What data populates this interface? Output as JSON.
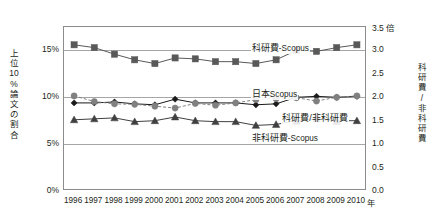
{
  "chart_data": {
    "type": "line",
    "title": "",
    "xlabel": "年",
    "x": [
      1996,
      1997,
      1998,
      1999,
      2000,
      2001,
      2002,
      2003,
      2004,
      2005,
      2006,
      2007,
      2008,
      2009,
      2010
    ],
    "x_tick_labels": [
      "1996",
      "1997",
      "1998",
      "1999",
      "2000",
      "2001",
      "2002",
      "2003",
      "2004",
      "2005",
      "2006",
      "2007",
      "2008",
      "2009",
      "2010"
    ],
    "x_unit_label": "年",
    "grid": true,
    "legend_position": "inline-annotations",
    "axes": {
      "left": {
        "label": "上位10%論文の割合",
        "label_chars": [
          "上",
          "位",
          "10",
          "%",
          "論",
          "文",
          "の",
          "割",
          "合"
        ],
        "ticks": [
          0,
          5,
          10,
          15
        ],
        "tick_labels": [
          "0%",
          "5%",
          "10%",
          "15%"
        ],
        "lim": [
          0,
          17.5
        ],
        "unit": "%"
      },
      "right": {
        "label": "科研費/非科研費",
        "label_chars": [
          "科",
          "研",
          "費",
          "/",
          "非",
          "科",
          "研",
          "費"
        ],
        "ticks": [
          0.0,
          0.5,
          1.0,
          1.5,
          2.0,
          2.5,
          3.0,
          3.5
        ],
        "tick_labels": [
          "0.0",
          "0.5",
          "1.0",
          "1.5",
          "2.0",
          "2.5",
          "3.0",
          "3.5"
        ],
        "lim": [
          0.0,
          3.5
        ],
        "unit": "倍",
        "unit_label": "3.5 倍"
      }
    },
    "series": [
      {
        "name": "科研費-Scopus",
        "label_jp": "科研費",
        "label_lat": "-Scopus",
        "axis": "left",
        "marker": "square",
        "color": "#595959",
        "linestyle": "solid",
        "values": [
          15.6,
          15.3,
          14.6,
          14.0,
          13.6,
          14.2,
          14.1,
          13.8,
          13.8,
          13.6,
          14.0,
          15.0,
          14.9,
          15.3,
          15.6
        ]
      },
      {
        "name": "日本Scopus",
        "label_jp": "日本",
        "label_lat": "Scopus",
        "axis": "left",
        "marker": "diamond",
        "color": "#1a1a1a",
        "linestyle": "solid",
        "values": [
          9.4,
          9.4,
          9.5,
          9.3,
          9.2,
          9.8,
          9.4,
          9.4,
          9.4,
          9.2,
          9.3,
          10.0,
          10.1,
          10.0,
          10.1
        ]
      },
      {
        "name": "非科研費-Scopus",
        "label_jp": "非科研費",
        "label_lat": "-Scopus",
        "axis": "left",
        "marker": "triangle",
        "color": "#404040",
        "linestyle": "solid",
        "values": [
          7.6,
          7.7,
          7.8,
          7.4,
          7.5,
          7.9,
          7.5,
          7.4,
          7.4,
          7.0,
          7.1,
          7.5,
          7.7,
          7.5,
          7.5
        ]
      },
      {
        "name": "科研費/非科研費",
        "label_jp": "科研費/非科研費",
        "label_lat": "",
        "axis": "right",
        "marker": "circle",
        "color": "#808080",
        "linestyle": "dashed",
        "values": [
          2.03,
          1.91,
          1.86,
          1.85,
          1.81,
          1.77,
          1.87,
          1.83,
          1.88,
          1.95,
          1.97,
          1.99,
          1.92,
          2.0,
          2.03
        ]
      }
    ],
    "annotations": [
      {
        "name": "科研費-Scopus",
        "x_pct": 62,
        "y_pct": 9
      },
      {
        "name": "日本Scopus",
        "x_pct": 62,
        "y_pct": 37
      },
      {
        "name": "科研費/非科研費",
        "x_pct": 72,
        "y_pct": 52
      },
      {
        "name": "非科研費-Scopus",
        "x_pct": 62,
        "y_pct": 64
      }
    ]
  }
}
